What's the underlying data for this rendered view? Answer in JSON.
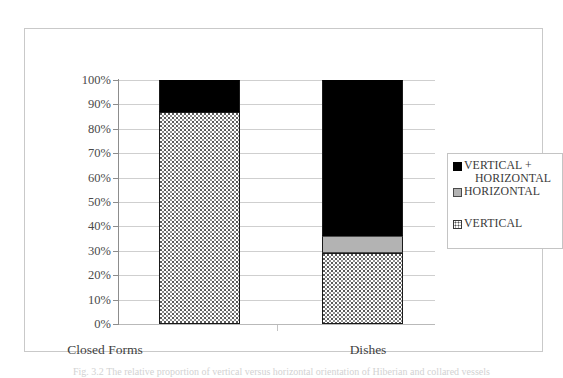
{
  "figure": {
    "caption": "Fig. 3.2 The relative proportion of vertical versus horizontal orientation of Hiberian and collared vessels"
  },
  "chart_data": {
    "type": "bar",
    "stacked": true,
    "normalized_percent": true,
    "title": "",
    "xlabel": "",
    "ylabel": "",
    "categories": [
      "Closed Forms",
      "Dishes"
    ],
    "series": [
      {
        "name": "VERTICAL",
        "values": [
          87,
          29
        ],
        "color": "#ffffff",
        "pattern": "dotted-stipple"
      },
      {
        "name": "HORIZONTAL",
        "values": [
          0,
          7
        ],
        "color": "#b3b3b3",
        "pattern": "solid-gray"
      },
      {
        "name": "VERTICAL + HORIZONTAL",
        "values": [
          13,
          64
        ],
        "color": "#000000",
        "pattern": "solid-black"
      }
    ],
    "stack_order_bottom_to_top": [
      "VERTICAL",
      "HORIZONTAL",
      "VERTICAL + HORIZONTAL"
    ],
    "ylim": [
      0,
      100
    ],
    "ytick_labels": [
      "100%",
      "90%",
      "80%",
      "70%",
      "60%",
      "50%",
      "40%",
      "30%",
      "20%",
      "10%",
      "0%"
    ],
    "ytick_values": [
      100,
      90,
      80,
      70,
      60,
      50,
      40,
      30,
      20,
      10,
      0
    ],
    "grid": true,
    "legend_position": "right"
  },
  "legend": {
    "entries": [
      {
        "label_line1": "VERTICAL +",
        "label_line2": "HORIZONTAL",
        "swatch": "black-square-icon"
      },
      {
        "label_line1": "HORIZONTAL",
        "label_line2": "",
        "swatch": "gray-square-icon"
      },
      {
        "label_line1": "VERTICAL",
        "label_line2": "",
        "swatch": "dotted-square-icon"
      }
    ]
  }
}
